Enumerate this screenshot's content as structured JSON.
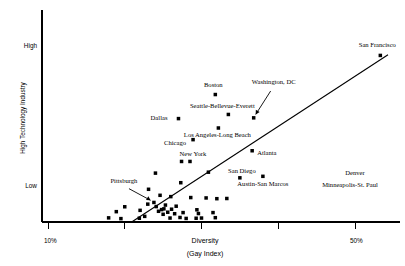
{
  "chart_data": {
    "type": "scatter",
    "title": "",
    "xlabel": "Diversity",
    "xlabel_sub": "(Gay Index)",
    "ylabel": "High Technology Industry",
    "xlim": [
      10,
      55
    ],
    "ylim": [
      0,
      100
    ],
    "grid": false,
    "legend": "none",
    "xticks": [
      {
        "value": 10,
        "label": "10%"
      },
      {
        "value": 20,
        "label": ""
      },
      {
        "value": 30,
        "label": ""
      },
      {
        "value": 40,
        "label": ""
      },
      {
        "value": 50,
        "label": "50%"
      }
    ],
    "yticks": [
      {
        "value": 88,
        "label": "High"
      },
      {
        "value": 22,
        "label": "Low"
      }
    ],
    "trendline": {
      "x_start": 20.9,
      "y_start": 0,
      "x_end": 54.3,
      "y_end": 89
    },
    "labeled_points": [
      {
        "name": "San Francisco",
        "x": 53.3,
        "y": 88.6,
        "label_dx": -3,
        "label_dy": -8,
        "label_anchor": "middle",
        "leader": false
      },
      {
        "name": "Boston",
        "x": 31.8,
        "y": 67.8,
        "label_dx": -2,
        "label_dy": -8,
        "label_anchor": "middle",
        "leader": false
      },
      {
        "name": "Washington, DC",
        "x": 36.8,
        "y": 55.4,
        "label_dx": 20,
        "label_dy": -34,
        "label_anchor": "middle",
        "leader": true
      },
      {
        "name": "Seattle-Bellevue-Everett",
        "x": 33.5,
        "y": 57.2,
        "label_dx": -6,
        "label_dy": -6,
        "label_anchor": "middle",
        "leader": false
      },
      {
        "name": "Dallas",
        "x": 27.0,
        "y": 55.0,
        "label_dx": -11,
        "label_dy": 1,
        "label_anchor": "end",
        "leader": false
      },
      {
        "name": "Los Angeles-Long Beach",
        "x": 32.2,
        "y": 50.0,
        "label_dx": -1,
        "label_dy": 9,
        "label_anchor": "middle",
        "leader": false
      },
      {
        "name": "Chicago",
        "x": 28.9,
        "y": 43.8,
        "label_dx": -7,
        "label_dy": 5,
        "label_anchor": "end",
        "leader": false
      },
      {
        "name": "Atlanta",
        "x": 36.6,
        "y": 37.9,
        "label_dx": 5,
        "label_dy": 4,
        "label_anchor": "start",
        "leader": false
      },
      {
        "name": "New York",
        "x": 28.5,
        "y": 32.2,
        "label_dx": 3,
        "label_dy": -5,
        "label_anchor": "middle",
        "leader": false
      },
      {
        "name": "San Diego",
        "x": 35.0,
        "y": 23.5,
        "label_dx": 2,
        "label_dy": -5,
        "label_anchor": "middle",
        "leader": false
      },
      {
        "name": "Pittsburgh",
        "x": 23.8,
        "y": 10.4,
        "label_dx": -30,
        "label_dy": -19,
        "label_anchor": "middle",
        "leader": true
      },
      {
        "name": "Austin-San Marcos",
        "x": 38.0,
        "y": 24.3,
        "label_dx": 0,
        "label_dy": 10,
        "label_anchor": "middle",
        "leader": false
      },
      {
        "name": "Denver",
        "x": null,
        "y": null,
        "label_x": 355,
        "label_y": 175,
        "label_anchor": "middle",
        "leader": false
      },
      {
        "name": "Minneapolis-St. Paul",
        "x": null,
        "y": null,
        "label_x": 350,
        "label_y": 187,
        "label_anchor": "middle",
        "leader": false
      }
    ],
    "unlabeled_points": [
      {
        "x": 21.9,
        "y": 2.0
      },
      {
        "x": 22.0,
        "y": 6.2
      },
      {
        "x": 20.0,
        "y": 8.1
      },
      {
        "x": 18.9,
        "y": 5.5
      },
      {
        "x": 17.9,
        "y": 2.2
      },
      {
        "x": 23.1,
        "y": 17.4
      },
      {
        "x": 23.0,
        "y": 9.5
      },
      {
        "x": 24.0,
        "y": 26.0
      },
      {
        "x": 24.1,
        "y": 8.2
      },
      {
        "x": 24.4,
        "y": 5.7
      },
      {
        "x": 24.8,
        "y": 6.6
      },
      {
        "x": 25.0,
        "y": 4.1
      },
      {
        "x": 25.1,
        "y": 7.0
      },
      {
        "x": 25.3,
        "y": 9.0
      },
      {
        "x": 25.6,
        "y": 5.2
      },
      {
        "x": 25.9,
        "y": 2.1
      },
      {
        "x": 26.1,
        "y": 6.8
      },
      {
        "x": 26.5,
        "y": 4.4
      },
      {
        "x": 26.7,
        "y": 8.4
      },
      {
        "x": 27.2,
        "y": 2.4
      },
      {
        "x": 27.6,
        "y": 5.0
      },
      {
        "x": 28.0,
        "y": 1.9
      },
      {
        "x": 27.3,
        "y": 20.9
      },
      {
        "x": 27.4,
        "y": 32.2
      },
      {
        "x": 28.6,
        "y": 13.0
      },
      {
        "x": 29.3,
        "y": 2.0
      },
      {
        "x": 29.4,
        "y": 6.5
      },
      {
        "x": 29.6,
        "y": 4.5
      },
      {
        "x": 30.0,
        "y": 2.1
      },
      {
        "x": 30.6,
        "y": 12.8
      },
      {
        "x": 30.9,
        "y": 26.5
      },
      {
        "x": 31.5,
        "y": 5.0
      },
      {
        "x": 31.8,
        "y": 2.3
      },
      {
        "x": 32.0,
        "y": 12.4
      },
      {
        "x": 33.3,
        "y": 12.5
      },
      {
        "x": 22.6,
        "y": 3.0
      },
      {
        "x": 19.5,
        "y": 1.8
      },
      {
        "x": 26.0,
        "y": 13.5
      },
      {
        "x": 24.6,
        "y": 14.2
      }
    ]
  },
  "axis": {
    "y_high_label": "High",
    "y_low_label": "Low",
    "x_left_label": "10%",
    "x_right_label": "50%",
    "x_title": "Diversity",
    "x_subtitle": "(Gay Index)",
    "y_title": "High Technology Industry"
  },
  "colors": {
    "ink": "#000000",
    "background": "#ffffff"
  }
}
